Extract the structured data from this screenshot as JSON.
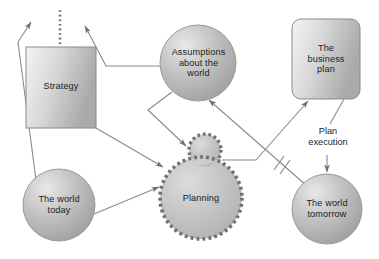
{
  "diagram": {
    "background_color": "#ffffff",
    "stroke_color": "#8a8a8a",
    "text_color": "#1c1c1c",
    "fill_light": "#f2f2f2",
    "fill_mid": "#c9c9c9",
    "fill_dark": "#a3a3a3",
    "nodes": [
      {
        "id": "strategy",
        "label": "Strategy",
        "shape": "rectangle",
        "fill": "#cccccc"
      },
      {
        "id": "assumptions",
        "label": "Assumptions\nabout the\nworld",
        "shape": "circle",
        "fill": "#b5b5b5"
      },
      {
        "id": "business-plan",
        "label": "The\nbusiness\nplan",
        "shape": "rounded-rectangle",
        "fill": "#cccccc"
      },
      {
        "id": "planning",
        "label": "Planning",
        "shape": "cloud",
        "fill": "#c4c4c4"
      },
      {
        "id": "world-today",
        "label": "The world\ntoday",
        "shape": "circle",
        "fill": "#b5b5b5"
      },
      {
        "id": "world-tomorrow",
        "label": "The world\ntomorrow",
        "shape": "circle",
        "fill": "#b5b5b5"
      }
    ],
    "edges": [
      {
        "id": "world-today-to-top",
        "from": "world-today",
        "to": "",
        "label": "",
        "arrow": true
      },
      {
        "id": "assumptions-to-top",
        "from": "assumptions",
        "to": "",
        "label": "",
        "arrow": true
      },
      {
        "id": "strategy-to-planning",
        "from": "strategy",
        "to": "planning",
        "label": "",
        "arrow": true
      },
      {
        "id": "assumptions-to-planning",
        "from": "assumptions",
        "to": "planning",
        "label": "",
        "arrow": true
      },
      {
        "id": "world-today-to-planning",
        "from": "world-today",
        "to": "planning",
        "label": "",
        "arrow": true
      },
      {
        "id": "planning-to-business-plan",
        "from": "planning",
        "to": "business-plan",
        "label": "",
        "arrow": true
      },
      {
        "id": "world-tomorrow-to-assumptions",
        "from": "world-tomorrow",
        "to": "assumptions",
        "label": "",
        "arrow": true
      },
      {
        "id": "business-plan-to-world-tomorrow",
        "from": "business-plan",
        "to": "world-tomorrow",
        "label": "Plan\nexecution",
        "arrow": true
      },
      {
        "id": "strategy-dotted-up",
        "from": "strategy",
        "to": "",
        "label": "",
        "arrow": false
      }
    ],
    "edge_labels": {
      "plan_execution": "Plan\nexecution"
    }
  }
}
